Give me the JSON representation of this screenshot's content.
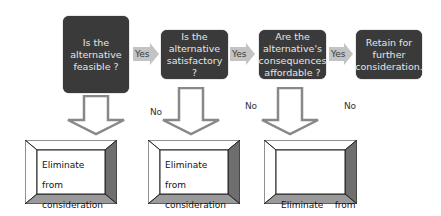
{
  "decisions": [
    {
      "label": "Is the alternative feasible ?"
    },
    {
      "label": "Is the alternative satisfactory ?"
    },
    {
      "label": "Are the alternative's consequences affordable ?"
    }
  ],
  "final": {
    "label": "Retain for further consideration."
  },
  "yes_label": "Yes",
  "no_label": "No",
  "eliminate": [
    {
      "line1": "Eliminate from",
      "line2": "consideration"
    },
    {
      "line1": "Eliminate from",
      "line2": "consideration"
    },
    {
      "line1": "Eliminate    from",
      "line2": "consideration"
    }
  ],
  "colors": {
    "decision_fill": "#3a3a3a",
    "decision_text": "#e6e6e6",
    "yes_arrow": "#c3c3c3",
    "bevel_top": "#ffffff",
    "bevel_right": "#6e6e6e",
    "bevel_bottom": "#9a9a9a"
  }
}
